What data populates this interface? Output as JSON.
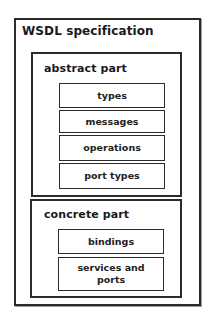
{
  "diagram": {
    "title": "WSDL specification",
    "abstract": {
      "label": "abstract part",
      "items": [
        "types",
        "messages",
        "operations",
        "port types"
      ]
    },
    "concrete": {
      "label": "concrete part",
      "items": [
        "bindings",
        "services and ports"
      ]
    }
  }
}
